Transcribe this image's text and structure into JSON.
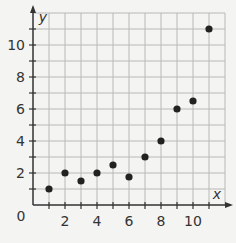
{
  "chart_data": {
    "type": "scatter",
    "title": "",
    "xlabel": "x",
    "ylabel": "y",
    "xlim": [
      0,
      12
    ],
    "ylim": [
      0,
      12
    ],
    "grid": true,
    "x_ticks": [
      "2",
      "4",
      "6",
      "8",
      "10"
    ],
    "y_ticks": [
      "2",
      "4",
      "6",
      "8",
      "10"
    ],
    "origin_label": "0",
    "points": [
      {
        "x": 1,
        "y": 1
      },
      {
        "x": 2,
        "y": 2
      },
      {
        "x": 3,
        "y": 1.5
      },
      {
        "x": 4,
        "y": 2
      },
      {
        "x": 5,
        "y": 2.5
      },
      {
        "x": 6,
        "y": 1.75
      },
      {
        "x": 7,
        "y": 3
      },
      {
        "x": 8,
        "y": 4
      },
      {
        "x": 9,
        "y": 6
      },
      {
        "x": 10,
        "y": 6.5
      },
      {
        "x": 11,
        "y": 11
      }
    ]
  },
  "colors": {
    "grid": "#b8b8b8",
    "axis": "#333333",
    "point": "#222222",
    "background": "#f4f4f2"
  }
}
